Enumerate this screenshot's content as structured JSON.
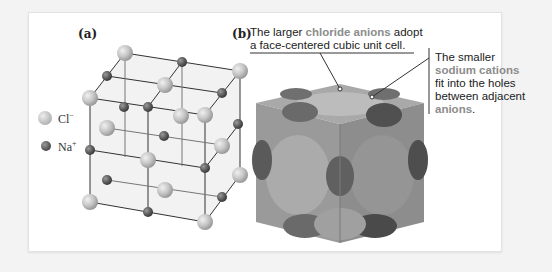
{
  "panel_a": {
    "label": "(a)",
    "legend": [
      {
        "name": "chloride",
        "symbol": "Cl",
        "charge": "−",
        "color": "#c9c9c9"
      },
      {
        "name": "sodium",
        "symbol": "Na",
        "charge": "+",
        "color": "#6e6e6e"
      }
    ]
  },
  "panel_b": {
    "label": "(b)",
    "caption_top": {
      "pre": "The larger ",
      "highlight": "chloride anions",
      "post_line1": " adopt",
      "line2": "a face-centered cubic unit cell."
    },
    "caption_right": {
      "line1": "The smaller",
      "highlight": "sodium cations",
      "line3": "fit into the holes",
      "line4": "between adjacent",
      "highlight2": "anions",
      "end": "."
    }
  },
  "colors": {
    "anion": "#b4b4b4",
    "cation": "#5e5e5e",
    "highlight_text": "#8c8c8c"
  }
}
